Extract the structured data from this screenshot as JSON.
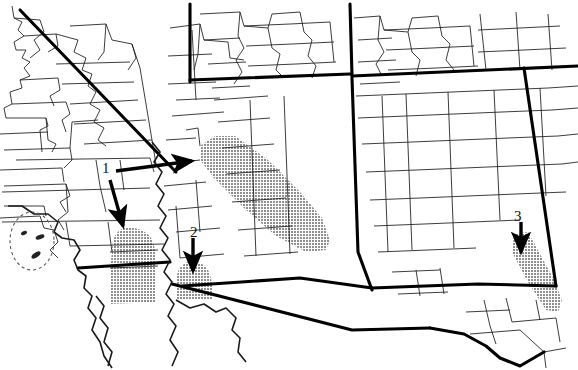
{
  "figure": {
    "kind": "map",
    "width": 578,
    "height": 370,
    "background_color": "#ffffff",
    "line_color": "#000000",
    "shade_color": "#a9a9a9",
    "shade_pattern": "halftone-dither-gray"
  },
  "annotations": [
    {
      "id": "annotation-1",
      "label": "1",
      "label_x": 104,
      "label_y": 163,
      "arrows": 2,
      "arrow_targets": [
        "large-diagonal-shaded-band",
        "western-shaded-region"
      ]
    },
    {
      "id": "annotation-2",
      "label": "2",
      "label_x": 192,
      "label_y": 228,
      "arrows": 1,
      "arrow_targets": [
        "central-small-shaded-region"
      ]
    },
    {
      "id": "annotation-3",
      "label": "3",
      "label_x": 512,
      "label_y": 212,
      "arrows": 1,
      "arrow_targets": [
        "eastern-diagonal-shaded-region"
      ]
    }
  ],
  "shaded_regions": [
    {
      "id": "large-diagonal-shaded-band",
      "name": "large-diagonal-shaded-band",
      "description": "Elongated NE-SW oriented shaded band in the north-central map area",
      "pointed_by": "1"
    },
    {
      "id": "western-shaded-region",
      "name": "western-shaded-region",
      "description": "Rounded vertical shaded patch in the western map area",
      "pointed_by": "1"
    },
    {
      "id": "central-small-shaded-region",
      "name": "central-small-shaded-region",
      "description": "Small rounded shaded patch left of center-south",
      "pointed_by": "2"
    },
    {
      "id": "eastern-diagonal-shaded-region",
      "name": "eastern-diagonal-shaded-region",
      "description": "Narrow diagonal shaded strip at the eastern edge",
      "pointed_by": "3"
    }
  ],
  "map_features": {
    "heavy_boundaries": "state-level borders drawn as thick black lines",
    "light_boundaries": "county-level borders drawn as thin black lines",
    "dashed_feature": "dashed offshore oval with small islands on the lower-left coast",
    "coastline": "irregular coastline along the left edge",
    "international_border": "wavy southern border with diagonal segment"
  }
}
